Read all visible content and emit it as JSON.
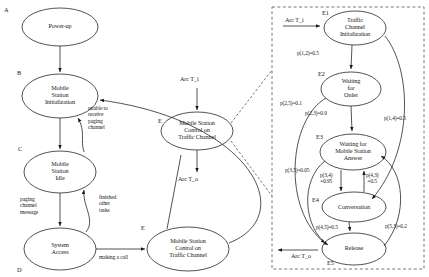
{
  "diagram": {
    "type": "state-transition-diagram",
    "left_panel": {
      "nodes": [
        {
          "key": "A",
          "label": "Power-up"
        },
        {
          "key": "B",
          "label": "Mobile\nStation\nInitialization"
        },
        {
          "key": "C",
          "label": "Mobile\nStation\nIdle"
        },
        {
          "key": "D",
          "label": "System\nAccess"
        },
        {
          "key": "E",
          "label": "Mobile Station\nControl on\nTraffic Channel"
        }
      ],
      "edge_labels": [
        {
          "text": "unable to\nreceive\npaging\nchannel"
        },
        {
          "text": "paging\nchannel\nmessage"
        },
        {
          "text": "finished\nother\ntasks"
        },
        {
          "text": "making a call"
        }
      ]
    },
    "center_panel": {
      "node": {
        "key": "E",
        "label": "Mobile Station\nControl on\nTraffic Channel"
      },
      "arc_in": "Arc T_i",
      "arc_out": "Arc T_o"
    },
    "right_panel": {
      "arc_in": "Arc T_i",
      "arc_out": "Arc T_o",
      "nodes": [
        {
          "key": "E1",
          "label": "Traffic\nChannel\nInitialization"
        },
        {
          "key": "E2",
          "label": "Waiting\nfor\nOrder"
        },
        {
          "key": "E3",
          "label": "Waiting for\nMobile Station\nAnswer"
        },
        {
          "key": "E4",
          "label": "Conversation"
        },
        {
          "key": "E5",
          "label": "Release"
        }
      ],
      "transitions": [
        {
          "id": "p12",
          "label": "p(1,2)=0.5",
          "from": "E1",
          "to": "E2",
          "value": 0.5
        },
        {
          "id": "p14",
          "label": "p(1,4)=0.5",
          "from": "E1",
          "to": "E4",
          "value": 0.5
        },
        {
          "id": "p23",
          "label": "p(2,3)=0.9",
          "from": "E2",
          "to": "E3",
          "value": 0.9
        },
        {
          "id": "p25",
          "label": "p(2,5)=0.1",
          "from": "E2",
          "to": "E5",
          "value": 0.1
        },
        {
          "id": "p34",
          "label": "p(3,4)\n=0.95",
          "from": "E3",
          "to": "E4",
          "value": 0.95
        },
        {
          "id": "p35",
          "label": "p(3,5)=0.05",
          "from": "E3",
          "to": "E5",
          "value": 0.05
        },
        {
          "id": "p43",
          "label": "p(4,3)\n=0.5",
          "from": "E4",
          "to": "E3",
          "value": 0.5
        },
        {
          "id": "p45",
          "label": "p(4,5)=0.5",
          "from": "E4",
          "to": "E5",
          "value": 0.5
        },
        {
          "id": "p53",
          "label": "p(5,3)=0.2",
          "from": "E5",
          "to": "E3",
          "value": 0.2
        }
      ]
    },
    "colors": {
      "stroke": "#1a1a1a",
      "text": "#1a1a1a",
      "background": "#ffffff",
      "dashed_border": "#555555"
    }
  }
}
